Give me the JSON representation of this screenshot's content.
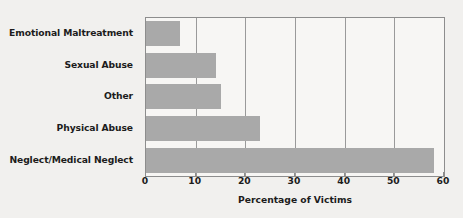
{
  "chart_data": {
    "type": "bar",
    "orientation": "horizontal",
    "title": "",
    "subtitle": "",
    "xlabel": "Percentage of Victims",
    "ylabel": "",
    "categories": [
      "Emotional Maltreatment",
      "Sexual Abuse",
      "Other",
      "Physical Abuse",
      "Neglect/Medical Neglect"
    ],
    "values": [
      6.8,
      14.0,
      15.2,
      23.0,
      58.0
    ],
    "xlim": [
      0,
      60
    ],
    "ylim": null,
    "xticks": [
      0,
      10,
      20,
      30,
      40,
      50,
      60
    ],
    "xtick_labels": [
      "0",
      "10",
      "20",
      "30",
      "40",
      "50",
      "60"
    ],
    "grid": "vertical",
    "legend": null,
    "legend_position": "none",
    "series": [
      {
        "name": "Percentage of Victims",
        "values": [
          6.8,
          14.0,
          15.2,
          23.0,
          58.0
        ]
      }
    ],
    "colors": {
      "bar_fill": "#a9a9a9",
      "background": "#f1f0ee",
      "plot_background": "#f7f6f4",
      "gridline": "#9a9a9a",
      "axis_line": "#8d8d8d",
      "text": "#1c1c1c"
    }
  }
}
